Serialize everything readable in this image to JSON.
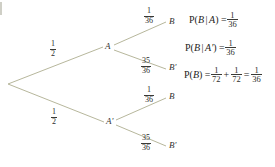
{
  "diagram": {
    "type": "probability-tree",
    "root": {
      "label": ""
    },
    "branches": [
      {
        "id": "root-to-A",
        "probability": {
          "numerator": "1",
          "denominator": "2"
        },
        "to_node": "A"
      },
      {
        "id": "root-to-Anot",
        "probability": {
          "numerator": "1",
          "denominator": "2"
        },
        "to_node": "A'"
      },
      {
        "id": "A-to-B",
        "probability": {
          "numerator": "1",
          "denominator": "36"
        },
        "to_node": "B"
      },
      {
        "id": "A-to-Bnot",
        "probability": {
          "numerator": "35",
          "denominator": "36"
        },
        "to_node": "B'"
      },
      {
        "id": "Anot-to-B",
        "probability": {
          "numerator": "1",
          "denominator": "36"
        },
        "to_node": "B"
      },
      {
        "id": "Anot-to-Bnot",
        "probability": {
          "numerator": "35",
          "denominator": "36"
        },
        "to_node": "B'"
      }
    ],
    "nodes": {
      "a": "A",
      "a_not": "A'",
      "b_top": "B",
      "b_not_top": "B'",
      "b_bottom": "B",
      "b_not_bottom": "B'"
    }
  },
  "equations": {
    "line1": {
      "lhs_p": "P(",
      "lhs_event": "B",
      "lhs_bar": "|",
      "lhs_cond": "A",
      "lhs_close": ") =",
      "rhs": {
        "numerator": "1",
        "denominator": "36"
      }
    },
    "line2": {
      "lhs_p": "P(",
      "lhs_event": "B",
      "lhs_bar": "|",
      "lhs_cond": "A'",
      "lhs_close": ") =",
      "rhs": {
        "numerator": "1",
        "denominator": "36"
      }
    },
    "line3": {
      "lhs_p": "P(",
      "lhs_event": "B",
      "lhs_close": ") =",
      "term1": {
        "numerator": "1",
        "denominator": "72"
      },
      "plus": "+",
      "term2": {
        "numerator": "1",
        "denominator": "72"
      },
      "equals": "=",
      "result": {
        "numerator": "1",
        "denominator": "36"
      }
    }
  },
  "style": {
    "line_color": "#b7b79c",
    "text_color": "#1d1d1b",
    "background": "#ffffff"
  }
}
